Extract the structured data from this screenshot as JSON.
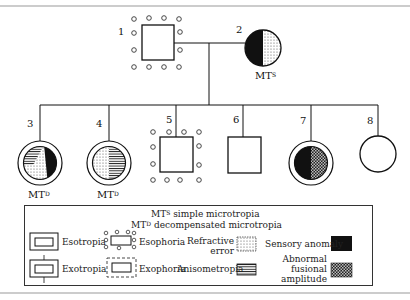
{
  "pedigree": {
    "individuals": [
      {
        "id": "1",
        "number_label": "1",
        "sex": "male",
        "traits": [
          "esophoria"
        ],
        "annotation": ""
      },
      {
        "id": "2",
        "number_label": "2",
        "sex": "female",
        "traits": [
          "sensory_anomaly",
          "refractive_error"
        ],
        "annotation_base": "MT",
        "annotation_sup": "S"
      },
      {
        "id": "3",
        "number_label": "3",
        "sex": "female",
        "traits": [
          "exotropia_ring",
          "anisometropia",
          "refractive_error",
          "sensory_anomaly"
        ],
        "annotation_base": "MT",
        "annotation_sup": "D"
      },
      {
        "id": "4",
        "number_label": "4",
        "sex": "female",
        "traits": [
          "exotropia_ring",
          "refractive_error",
          "anisometropia"
        ],
        "annotation_base": "MT",
        "annotation_sup": "D"
      },
      {
        "id": "5",
        "number_label": "5",
        "sex": "male",
        "traits": [
          "esophoria"
        ],
        "annotation": ""
      },
      {
        "id": "6",
        "number_label": "6",
        "sex": "male",
        "traits": [],
        "annotation": ""
      },
      {
        "id": "7",
        "number_label": "7",
        "sex": "female",
        "traits": [
          "exotropia_ring",
          "sensory_anomaly",
          "abnormal_fusional_amplitude"
        ],
        "annotation": ""
      },
      {
        "id": "8",
        "number_label": "8",
        "sex": "female",
        "traits": [],
        "annotation": ""
      }
    ]
  },
  "legend": {
    "mt_s": {
      "base": "MT",
      "sup": "S",
      "text": " simple microtropia"
    },
    "mt_d": {
      "base": "MT",
      "sup": "D",
      "text": " decompensated microtropia"
    },
    "items": {
      "esotropia": "Esotropia",
      "exotropia": "Exotropia",
      "esophoria": "Esophoria",
      "exophoria": "Exophoria",
      "refractive_error_1": "Refractive",
      "refractive_error_2": "error",
      "anisometropia": "Anisometropia",
      "sensory_anomaly": "Sensory anomaly",
      "fusional_1": "Abnormal",
      "fusional_2": "fusional",
      "fusional_3": "amplitude"
    }
  },
  "colors": {
    "ink": "#111111",
    "frame": "#888888",
    "dots": "#444444"
  }
}
